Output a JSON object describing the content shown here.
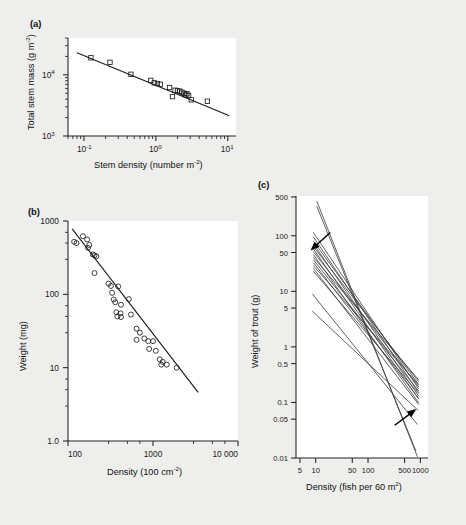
{
  "figure": {
    "background_color": "#eeeeec",
    "panel_labels": {
      "a": "(a)",
      "b": "(b)",
      "c": "(c)"
    }
  },
  "chart_data": [
    {
      "id": "panel-a",
      "panel_label": "(a)",
      "type": "scatter",
      "title": "",
      "xlabel": "Stem density (number m",
      "xlabel_sup": "-2",
      "xlabel_tail": ")",
      "ylabel": "Total stem mass (g m",
      "ylabel_sup": "-2",
      "ylabel_tail": ")",
      "xscale": "log",
      "yscale": "log",
      "xlim": [
        0.06,
        13
      ],
      "ylim": [
        1000,
        40000
      ],
      "xticks": [
        0.1,
        1,
        10
      ],
      "xticklabels": [
        "10-1",
        "10 0",
        "10 1"
      ],
      "xtick_bases": [
        "10",
        "10",
        "10"
      ],
      "xtick_exps": [
        "-1",
        "0",
        "1"
      ],
      "yticks": [
        1000,
        10000
      ],
      "ytick_bases": [
        "10",
        "10"
      ],
      "ytick_exps": [
        "3",
        "4"
      ],
      "marker": "square",
      "points": [
        {
          "x": 0.125,
          "y": 19000
        },
        {
          "x": 0.23,
          "y": 16000
        },
        {
          "x": 0.45,
          "y": 10200
        },
        {
          "x": 0.85,
          "y": 8100
        },
        {
          "x": 0.95,
          "y": 7400
        },
        {
          "x": 1.05,
          "y": 7200
        },
        {
          "x": 1.15,
          "y": 7000
        },
        {
          "x": 1.55,
          "y": 6200
        },
        {
          "x": 1.7,
          "y": 4400
        },
        {
          "x": 1.85,
          "y": 5600
        },
        {
          "x": 2.0,
          "y": 5500
        },
        {
          "x": 2.15,
          "y": 5400
        },
        {
          "x": 2.3,
          "y": 5200
        },
        {
          "x": 2.45,
          "y": 5000
        },
        {
          "x": 2.6,
          "y": 4700
        },
        {
          "x": 2.7,
          "y": 4900
        },
        {
          "x": 2.85,
          "y": 4600
        },
        {
          "x": 3.1,
          "y": 3900
        },
        {
          "x": 5.2,
          "y": 3700
        }
      ],
      "fit_line": {
        "x1": 0.08,
        "y1": 23000,
        "x2": 10.5,
        "y2": 2150
      }
    },
    {
      "id": "panel-b",
      "panel_label": "(b)",
      "type": "scatter",
      "title": "",
      "xlabel": "Density (100 cm",
      "xlabel_sup": "-2",
      "xlabel_tail": ")",
      "ylabel": "Weight (mg)",
      "xscale": "log",
      "yscale": "log",
      "xlim": [
        100,
        10000
      ],
      "ylim": [
        1.0,
        1000
      ],
      "xticks": [
        100,
        1000,
        10000
      ],
      "xticklabels": [
        "100",
        "1000",
        "10 000"
      ],
      "yticks": [
        1.0,
        10,
        100,
        1000
      ],
      "yticklabels": [
        "1.0",
        "10",
        "100",
        "1000"
      ],
      "marker": "circle",
      "points": [
        {
          "x": 118,
          "y": 520
        },
        {
          "x": 126,
          "y": 500
        },
        {
          "x": 150,
          "y": 620
        },
        {
          "x": 168,
          "y": 560
        },
        {
          "x": 172,
          "y": 430
        },
        {
          "x": 178,
          "y": 470
        },
        {
          "x": 196,
          "y": 350
        },
        {
          "x": 205,
          "y": 340
        },
        {
          "x": 215,
          "y": 330
        },
        {
          "x": 205,
          "y": 195
        },
        {
          "x": 300,
          "y": 140
        },
        {
          "x": 320,
          "y": 130
        },
        {
          "x": 330,
          "y": 105
        },
        {
          "x": 390,
          "y": 128
        },
        {
          "x": 345,
          "y": 85
        },
        {
          "x": 360,
          "y": 78
        },
        {
          "x": 420,
          "y": 72
        },
        {
          "x": 520,
          "y": 86
        },
        {
          "x": 370,
          "y": 57
        },
        {
          "x": 380,
          "y": 50
        },
        {
          "x": 415,
          "y": 55
        },
        {
          "x": 420,
          "y": 49
        },
        {
          "x": 550,
          "y": 53
        },
        {
          "x": 640,
          "y": 34
        },
        {
          "x": 700,
          "y": 30
        },
        {
          "x": 640,
          "y": 24
        },
        {
          "x": 790,
          "y": 25
        },
        {
          "x": 880,
          "y": 23
        },
        {
          "x": 1000,
          "y": 23
        },
        {
          "x": 900,
          "y": 18
        },
        {
          "x": 1080,
          "y": 17
        },
        {
          "x": 1200,
          "y": 13
        },
        {
          "x": 1250,
          "y": 11
        },
        {
          "x": 1300,
          "y": 12
        },
        {
          "x": 1450,
          "y": 11
        },
        {
          "x": 1900,
          "y": 10
        }
      ],
      "fit_line": {
        "x1": 112,
        "y1": 780,
        "x2": 3400,
        "y2": 4.6
      }
    },
    {
      "id": "panel-c",
      "panel_label": "(c)",
      "type": "line",
      "title": "",
      "xlabel": "Density (fish per 60 m",
      "xlabel_sup": "2",
      "xlabel_tail": ")",
      "ylabel": "Weight of trout (g)",
      "xscale": "log",
      "yscale": "log",
      "xlim": [
        4.2,
        1400
      ],
      "ylim": [
        0.01,
        520
      ],
      "xticks": [
        5,
        10,
        50,
        100,
        500,
        1000
      ],
      "xticklabels": [
        "5",
        "10",
        "50",
        "100",
        "500",
        "1000"
      ],
      "yticks": [
        0.01,
        0.05,
        0.1,
        0.5,
        1,
        5,
        10,
        50,
        100,
        500
      ],
      "yticklabels": [
        "0.01",
        "0.05",
        "0.1",
        "0.5",
        "1",
        "5",
        "10",
        "50",
        "100",
        "500"
      ],
      "series": [
        {
          "name": "line-01",
          "x": [
            9.0,
            930
          ],
          "y": [
            115,
            0.175
          ]
        },
        {
          "name": "line-02",
          "x": [
            9.0,
            930
          ],
          "y": [
            96,
            0.15
          ]
        },
        {
          "name": "line-03",
          "x": [
            9.0,
            930
          ],
          "y": [
            80,
            0.21
          ]
        },
        {
          "name": "line-04",
          "x": [
            9.0,
            930
          ],
          "y": [
            72,
            0.13
          ]
        },
        {
          "name": "line-05",
          "x": [
            9.0,
            930
          ],
          "y": [
            64,
            0.235
          ]
        },
        {
          "name": "line-06",
          "x": [
            9.0,
            930
          ],
          "y": [
            58,
            0.115
          ]
        },
        {
          "name": "line-07",
          "x": [
            9.0,
            930
          ],
          "y": [
            52,
            0.19
          ]
        },
        {
          "name": "line-08",
          "x": [
            9.0,
            930
          ],
          "y": [
            46,
            0.098
          ]
        },
        {
          "name": "line-09",
          "x": [
            9.0,
            930
          ],
          "y": [
            41,
            0.255
          ]
        },
        {
          "name": "line-10",
          "x": [
            9.0,
            930
          ],
          "y": [
            37,
            0.16
          ]
        },
        {
          "name": "line-11",
          "x": [
            9.0,
            930
          ],
          "y": [
            33,
            0.118
          ]
        },
        {
          "name": "line-12",
          "x": [
            9.0,
            930
          ],
          "y": [
            29,
            0.205
          ]
        },
        {
          "name": "line-13",
          "x": [
            9.0,
            930
          ],
          "y": [
            26,
            0.092
          ]
        },
        {
          "name": "line-14",
          "x": [
            9.0,
            930
          ],
          "y": [
            23,
            0.145
          ]
        },
        {
          "name": "line-15",
          "x": [
            10.5,
            880
          ],
          "y": [
            420,
            0.0105
          ]
        },
        {
          "name": "line-16",
          "x": [
            10.5,
            820
          ],
          "y": [
            340,
            0.0135
          ]
        },
        {
          "name": "line-17",
          "x": [
            8.6,
            880
          ],
          "y": [
            9.0,
            0.04
          ]
        },
        {
          "name": "line-18",
          "x": [
            8.6,
            905
          ],
          "y": [
            4.4,
            0.072
          ]
        }
      ],
      "annotations": [
        {
          "name": "upper-arrow",
          "x": 7.2,
          "y": 50,
          "dx": 22,
          "dy": -20,
          "direction": "down-right"
        },
        {
          "name": "lower-arrow",
          "x": 930,
          "y": 0.082,
          "dx": -24,
          "dy": 18,
          "direction": "up-left"
        }
      ]
    }
  ]
}
